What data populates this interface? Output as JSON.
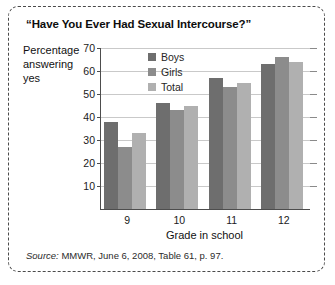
{
  "figure": {
    "title": "“Have You Ever Had Sexual Intercourse?”",
    "source_label": "Source:",
    "source_text": " MMWR, June 6, 2008, Table 61, p. 97."
  },
  "chart_data": {
    "type": "bar",
    "title": "“Have You Ever Had Sexual Intercourse?”",
    "xlabel": "Grade in school",
    "ylabel": "Percentage answering yes",
    "ylabel_lines": [
      "Percentage",
      "answering",
      "yes"
    ],
    "categories": [
      "9",
      "10",
      "11",
      "12"
    ],
    "series": [
      {
        "name": "Boys",
        "color": "#6e6e6e",
        "values": [
          38,
          46,
          57,
          63
        ]
      },
      {
        "name": "Girls",
        "color": "#8c8c8c",
        "values": [
          27,
          43,
          53,
          66
        ]
      },
      {
        "name": "Total",
        "color": "#b0b0b0",
        "values": [
          33,
          45,
          55,
          64
        ]
      }
    ],
    "ylim": [
      0,
      70
    ],
    "yticks": [
      70,
      60,
      50,
      40,
      30,
      20,
      10
    ],
    "grid": true,
    "legend_position": "upper-center"
  }
}
